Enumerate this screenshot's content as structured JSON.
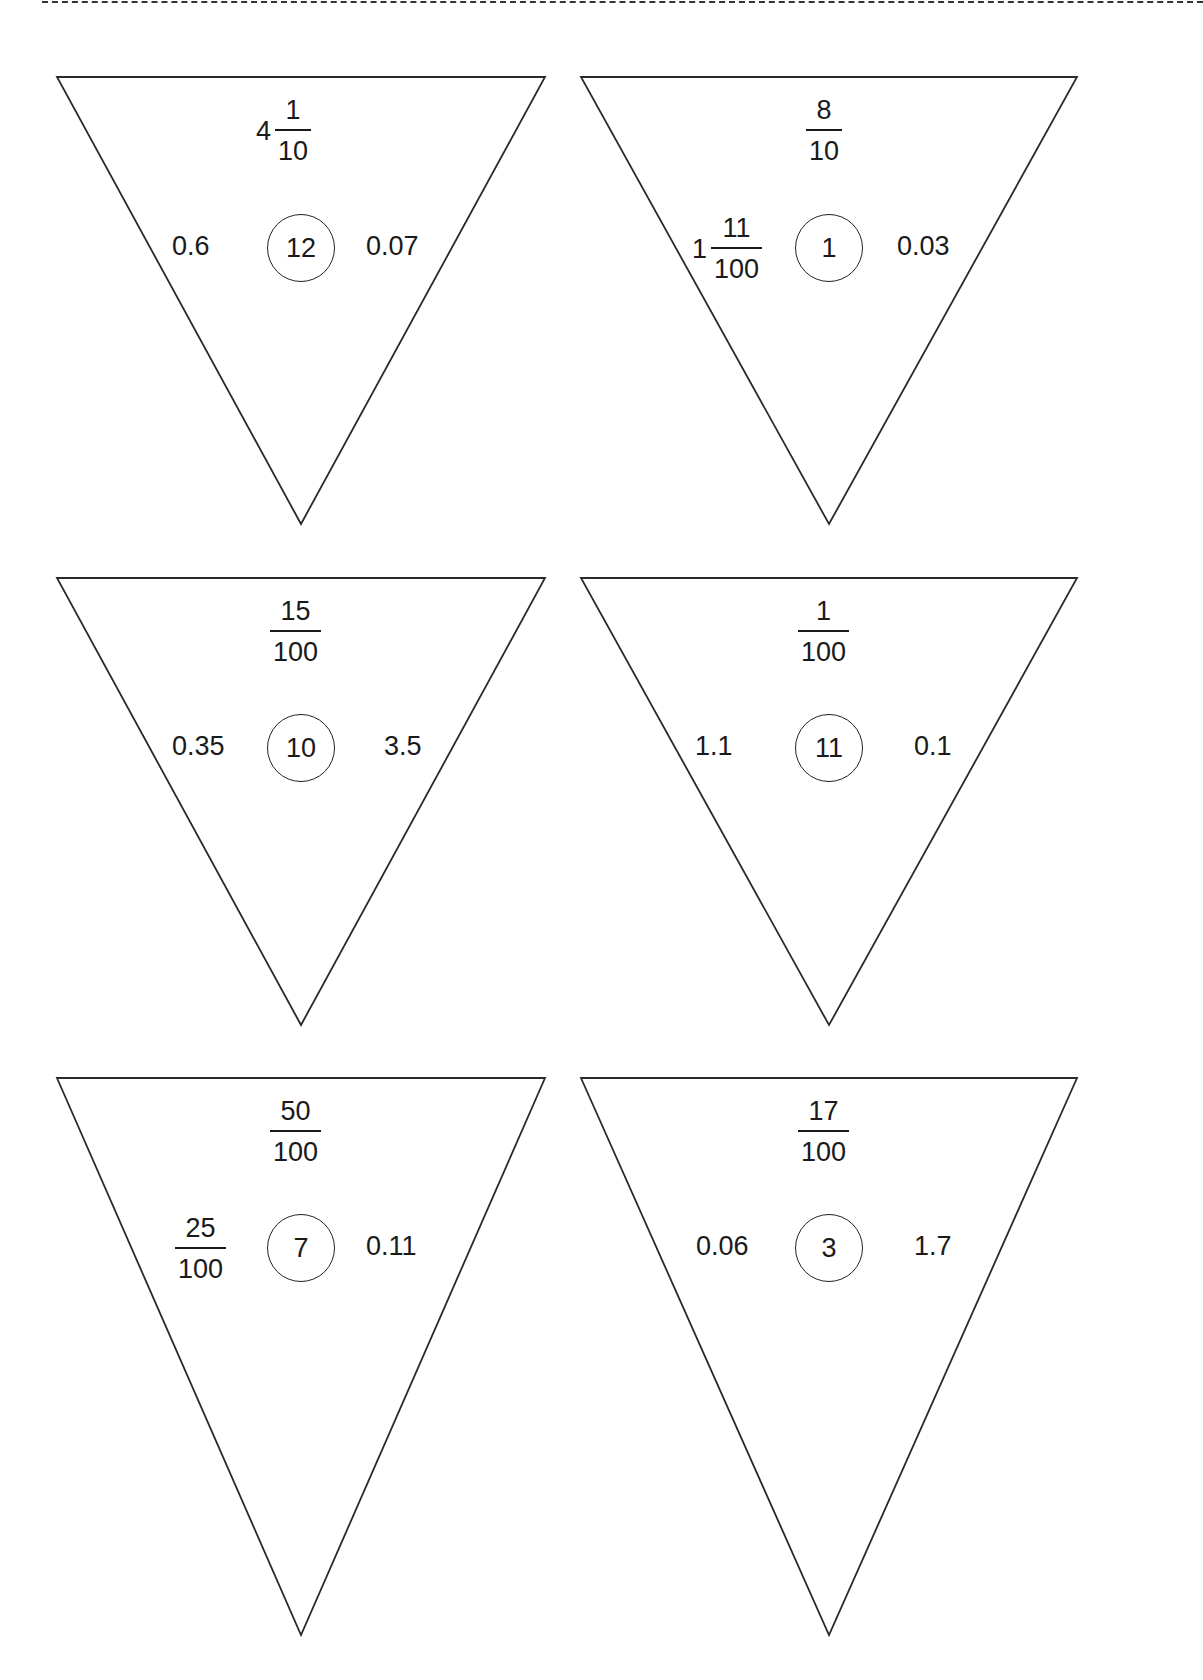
{
  "cards": [
    {
      "top": {
        "type": "mixed",
        "whole": "4",
        "numerator": "1",
        "denominator": "10"
      },
      "left": {
        "type": "decimal",
        "value": "0.6"
      },
      "center": "12",
      "right": {
        "type": "decimal",
        "value": "0.07"
      }
    },
    {
      "top": {
        "type": "fraction",
        "numerator": "8",
        "denominator": "10"
      },
      "left": {
        "type": "mixed",
        "whole": "1",
        "numerator": "11",
        "denominator": "100"
      },
      "center": "1",
      "right": {
        "type": "decimal",
        "value": "0.03"
      }
    },
    {
      "top": {
        "type": "fraction",
        "numerator": "15",
        "denominator": "100"
      },
      "left": {
        "type": "decimal",
        "value": "0.35"
      },
      "center": "10",
      "right": {
        "type": "decimal",
        "value": "3.5"
      }
    },
    {
      "top": {
        "type": "fraction",
        "numerator": "1",
        "denominator": "100"
      },
      "left": {
        "type": "decimal",
        "value": "1.1"
      },
      "center": "11",
      "right": {
        "type": "decimal",
        "value": "0.1"
      }
    },
    {
      "top": {
        "type": "fraction",
        "numerator": "50",
        "denominator": "100"
      },
      "left": {
        "type": "fraction",
        "numerator": "25",
        "denominator": "100"
      },
      "center": "7",
      "right": {
        "type": "decimal",
        "value": "0.11"
      }
    },
    {
      "top": {
        "type": "fraction",
        "numerator": "17",
        "denominator": "100"
      },
      "left": {
        "type": "decimal",
        "value": "0.06"
      },
      "center": "3",
      "right": {
        "type": "decimal",
        "value": "1.7"
      }
    }
  ]
}
